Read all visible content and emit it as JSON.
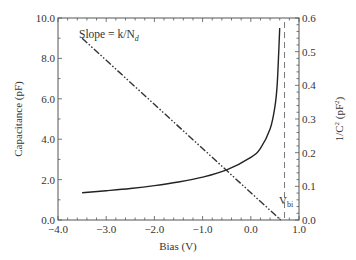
{
  "chart_data": {
    "type": "line",
    "title": "",
    "xlabel": "Bias (V)",
    "ylabel": "Capacitance (pF)",
    "y2label": "1/C² (pF²)",
    "xlim": [
      -4.0,
      1.0
    ],
    "ylim": [
      0.0,
      10.0
    ],
    "y2lim": [
      0.0,
      0.6
    ],
    "xticks": [
      "−4.0",
      "−3.0",
      "−2.0",
      "−1.0",
      "0.0",
      "1.0"
    ],
    "yticks": [
      "0.0",
      "2.0",
      "4.0",
      "6.0",
      "8.0",
      "10.0"
    ],
    "y2ticks": [
      "0.0",
      "0.1",
      "0.2",
      "0.3",
      "0.4",
      "0.5",
      "0.6"
    ],
    "grid": false,
    "series": [
      {
        "name": "Capacitance",
        "axis": "left",
        "style": "solid",
        "x": [
          -3.5,
          -3.0,
          -2.5,
          -2.0,
          -1.5,
          -1.0,
          -0.5,
          0.0,
          0.2,
          0.4,
          0.5,
          0.55,
          0.6
        ],
        "y": [
          1.35,
          1.45,
          1.56,
          1.7,
          1.88,
          2.12,
          2.48,
          3.1,
          3.55,
          4.5,
          5.6,
          6.8,
          9.5
        ]
      },
      {
        "name": "1/C²",
        "axis": "right",
        "style": "dash-dot",
        "x": [
          -3.5,
          0.62
        ],
        "y": [
          0.54,
          0.0
        ]
      }
    ],
    "annotations": [
      {
        "text": "Slope = k/N",
        "subscript": "d",
        "x": -3.4,
        "y": 9.1
      },
      {
        "text": "V",
        "subscript": "bi",
        "x": 0.72,
        "y": 0.55,
        "marker": "vertical dashed line at x=0.7"
      }
    ]
  },
  "labels": {
    "xlabel": "Bias (V)",
    "ylabel": "Capacitance (pF)",
    "y2label_main": "1/C",
    "y2label_sup": "2",
    "y2label_unit": " (pF",
    "y2label_unit_sup": "2",
    "y2label_close": ")",
    "slope_text": "Slope = k/N",
    "slope_sub": "d",
    "vbi_text": "V",
    "vbi_sub": "bi"
  }
}
